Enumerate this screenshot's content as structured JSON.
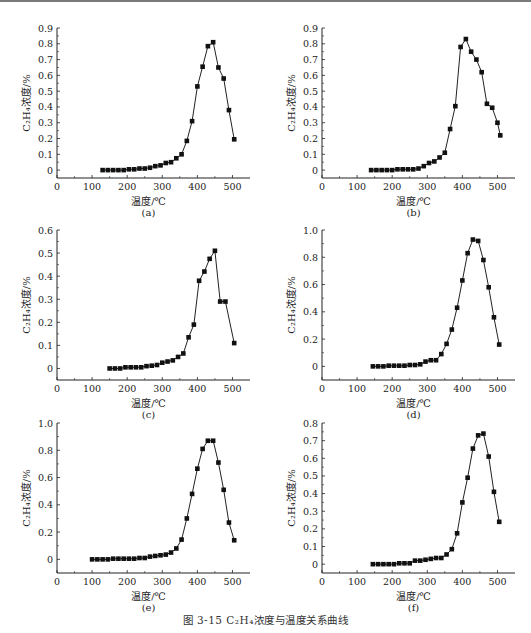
{
  "figure": {
    "caption": "图 3-15   C₂H₄浓度与温度关系曲线"
  },
  "chart_data": [
    {
      "id": "a",
      "type": "line",
      "sublabel": "(a)",
      "xlabel": "温度/℃",
      "ylabel": "C₂H₄浓度/%",
      "xlim": [
        0,
        550
      ],
      "ylim": [
        -0.05,
        0.9
      ],
      "xticks": [
        0,
        100,
        200,
        300,
        400,
        500
      ],
      "yticks": [
        0,
        0.1,
        0.2,
        0.3,
        0.4,
        0.5,
        0.6,
        0.7,
        0.8,
        0.9
      ],
      "ytick_labels": [
        "0",
        "0.1",
        "0.2",
        "0.3",
        "0.4",
        "0.5",
        "0.6",
        "0.7",
        "0.8",
        "0.9"
      ],
      "marker": "square",
      "grid": false,
      "x": [
        130,
        145,
        160,
        175,
        190,
        205,
        220,
        235,
        250,
        265,
        280,
        295,
        310,
        325,
        340,
        355,
        370,
        385,
        400,
        415,
        430,
        445,
        460,
        475,
        490,
        505
      ],
      "values": [
        0,
        0,
        0,
        0,
        0,
        0.005,
        0.005,
        0.01,
        0.01,
        0.015,
        0.025,
        0.03,
        0.045,
        0.05,
        0.075,
        0.1,
        0.185,
        0.31,
        0.53,
        0.655,
        0.785,
        0.81,
        0.65,
        0.58,
        0.38,
        0.195
      ]
    },
    {
      "id": "b",
      "type": "line",
      "sublabel": "(b)",
      "xlabel": "温度/℃",
      "ylabel": "C₂H₄浓度/%",
      "xlim": [
        0,
        550
      ],
      "ylim": [
        -0.05,
        0.9
      ],
      "xticks": [
        0,
        100,
        200,
        300,
        400,
        500
      ],
      "yticks": [
        0,
        0.1,
        0.2,
        0.3,
        0.4,
        0.5,
        0.6,
        0.7,
        0.8,
        0.9
      ],
      "ytick_labels": [
        "0",
        "0.1",
        "0.2",
        "0.3",
        "0.4",
        "0.5",
        "0.6",
        "0.7",
        "0.8",
        "0.9"
      ],
      "marker": "square",
      "grid": false,
      "x": [
        140,
        155,
        170,
        185,
        200,
        215,
        230,
        245,
        260,
        275,
        290,
        305,
        320,
        335,
        350,
        365,
        380,
        395,
        410,
        425,
        440,
        455,
        470,
        485,
        500,
        508
      ],
      "values": [
        0,
        0,
        0,
        0,
        0,
        0.005,
        0.005,
        0.005,
        0.005,
        0.01,
        0.025,
        0.045,
        0.055,
        0.08,
        0.11,
        0.26,
        0.405,
        0.78,
        0.83,
        0.75,
        0.7,
        0.62,
        0.42,
        0.395,
        0.3,
        0.22
      ]
    },
    {
      "id": "c",
      "type": "line",
      "sublabel": "(c)",
      "xlabel": "温度/℃",
      "ylabel": "C₂H₄浓度/%",
      "xlim": [
        0,
        550
      ],
      "ylim": [
        -0.05,
        0.6
      ],
      "xticks": [
        0,
        100,
        200,
        300,
        400,
        500
      ],
      "yticks": [
        0,
        0.1,
        0.2,
        0.3,
        0.4,
        0.5,
        0.6
      ],
      "ytick_labels": [
        "0",
        "0.1",
        "0.2",
        "0.3",
        "0.4",
        "0.5",
        "0.6"
      ],
      "marker": "square",
      "grid": false,
      "x": [
        150,
        165,
        180,
        195,
        210,
        225,
        240,
        255,
        270,
        285,
        300,
        315,
        330,
        345,
        360,
        375,
        390,
        405,
        420,
        435,
        450,
        465,
        480,
        505
      ],
      "values": [
        0,
        0,
        0,
        0.005,
        0.005,
        0.005,
        0.005,
        0.01,
        0.012,
        0.015,
        0.025,
        0.03,
        0.035,
        0.05,
        0.065,
        0.135,
        0.19,
        0.38,
        0.42,
        0.475,
        0.51,
        0.29,
        0.29,
        0.11
      ]
    },
    {
      "id": "d",
      "type": "line",
      "sublabel": "(d)",
      "xlabel": "温度/℃",
      "ylabel": "C₂H₄浓度/%",
      "xlim": [
        0,
        550
      ],
      "ylim": [
        -0.1,
        1.0
      ],
      "xticks": [
        0,
        100,
        200,
        300,
        400,
        500
      ],
      "yticks": [
        0,
        0.2,
        0.4,
        0.6,
        0.8,
        1.0
      ],
      "ytick_labels": [
        "0",
        "0.2",
        "0.4",
        "0.6",
        "0.8",
        "1.0"
      ],
      "marker": "square",
      "grid": false,
      "x": [
        145,
        160,
        175,
        190,
        205,
        220,
        235,
        250,
        265,
        280,
        295,
        310,
        325,
        340,
        355,
        370,
        385,
        400,
        415,
        430,
        445,
        460,
        475,
        490,
        505
      ],
      "values": [
        0,
        0,
        0,
        0.005,
        0.005,
        0.005,
        0.005,
        0.01,
        0.01,
        0.015,
        0.035,
        0.045,
        0.045,
        0.09,
        0.165,
        0.27,
        0.43,
        0.63,
        0.83,
        0.93,
        0.92,
        0.78,
        0.58,
        0.36,
        0.16
      ]
    },
    {
      "id": "e",
      "type": "line",
      "sublabel": "(e)",
      "xlabel": "温度/℃",
      "ylabel": "C₂H₄浓度/%",
      "xlim": [
        0,
        550
      ],
      "ylim": [
        -0.1,
        1.0
      ],
      "xticks": [
        0,
        100,
        200,
        300,
        400,
        500
      ],
      "yticks": [
        0,
        0.2,
        0.4,
        0.6,
        0.8,
        1.0
      ],
      "ytick_labels": [
        "0",
        "0.2",
        "0.4",
        "0.6",
        "0.8",
        "1.0"
      ],
      "marker": "square",
      "grid": false,
      "x": [
        100,
        115,
        130,
        145,
        160,
        175,
        190,
        205,
        220,
        235,
        250,
        265,
        280,
        295,
        310,
        325,
        340,
        355,
        370,
        385,
        400,
        415,
        430,
        445,
        460,
        475,
        490,
        505
      ],
      "values": [
        0,
        0,
        0,
        0,
        0.005,
        0.005,
        0.005,
        0.005,
        0.005,
        0.01,
        0.01,
        0.02,
        0.025,
        0.03,
        0.035,
        0.05,
        0.08,
        0.145,
        0.3,
        0.48,
        0.665,
        0.81,
        0.87,
        0.87,
        0.71,
        0.51,
        0.27,
        0.14
      ]
    },
    {
      "id": "f",
      "type": "line",
      "sublabel": "(f)",
      "xlabel": "温度/℃",
      "ylabel": "C₂H₄浓度/%",
      "xlim": [
        0,
        550
      ],
      "ylim": [
        -0.05,
        0.8
      ],
      "xticks": [
        0,
        100,
        200,
        300,
        400,
        500
      ],
      "yticks": [
        0,
        0.1,
        0.2,
        0.3,
        0.4,
        0.5,
        0.6,
        0.7,
        0.8
      ],
      "ytick_labels": [
        "0",
        "0.1",
        "0.2",
        "0.3",
        "0.4",
        "0.5",
        "0.6",
        "0.7",
        "0.8"
      ],
      "marker": "square",
      "grid": false,
      "x": [
        145,
        160,
        175,
        190,
        205,
        220,
        235,
        250,
        265,
        280,
        295,
        310,
        325,
        340,
        355,
        370,
        385,
        400,
        415,
        430,
        445,
        460,
        475,
        490,
        505
      ],
      "values": [
        0,
        0,
        0,
        0,
        0,
        0.005,
        0.005,
        0.005,
        0.02,
        0.02,
        0.025,
        0.03,
        0.035,
        0.035,
        0.055,
        0.085,
        0.175,
        0.35,
        0.49,
        0.655,
        0.73,
        0.74,
        0.61,
        0.41,
        0.24
      ]
    }
  ]
}
